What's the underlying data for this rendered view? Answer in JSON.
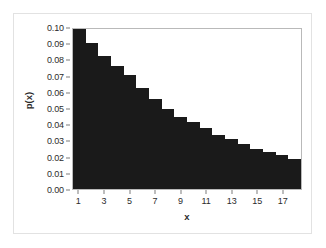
{
  "chart_data": {
    "type": "bar",
    "title": "",
    "subtitle": "",
    "xlabel": "x",
    "ylabel": "p(x)",
    "grid": false,
    "legend": false,
    "bar_color": "#1a1a1a",
    "frame_color": "#b9b9b9",
    "background": "#ffffff",
    "xlim": [
      0.5,
      18.5
    ],
    "ylim": [
      0.0,
      0.1
    ],
    "x": [
      1,
      2,
      3,
      4,
      5,
      6,
      7,
      8,
      9,
      10,
      11,
      12,
      13,
      14,
      15,
      16,
      17,
      18
    ],
    "values": [
      0.1,
      0.091,
      0.083,
      0.077,
      0.071,
      0.063,
      0.056,
      0.05,
      0.045,
      0.042,
      0.038,
      0.034,
      0.031,
      0.028,
      0.025,
      0.023,
      0.021,
      0.019
    ],
    "categories": [
      "1",
      "2",
      "3",
      "4",
      "5",
      "6",
      "7",
      "8",
      "9",
      "10",
      "11",
      "12",
      "13",
      "14",
      "15",
      "16",
      "17",
      "18"
    ],
    "xticks": [
      1,
      3,
      5,
      7,
      9,
      11,
      13,
      15,
      17
    ],
    "xticklabels": [
      "1",
      "3",
      "5",
      "7",
      "9",
      "11",
      "13",
      "15",
      "17"
    ],
    "yticks": [
      0.0,
      0.01,
      0.02,
      0.03,
      0.04,
      0.05,
      0.06,
      0.07,
      0.08,
      0.09,
      0.1
    ],
    "yticklabels": [
      "0.00",
      "0.01",
      "0.02",
      "0.03",
      "0.04",
      "0.05",
      "0.06",
      "0.07",
      "0.08",
      "0.09",
      "0.10"
    ],
    "annotations": []
  }
}
